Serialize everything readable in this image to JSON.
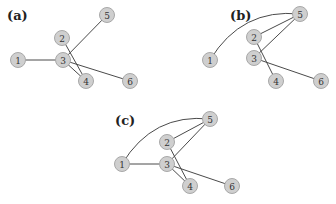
{
  "panels": [
    {
      "label": "(a)",
      "label_pos": [
        7,
        20
      ],
      "nodes": [
        {
          "id": "1",
          "x": 18,
          "y": 60
        },
        {
          "id": "2",
          "x": 62,
          "y": 38
        },
        {
          "id": "3",
          "x": 63,
          "y": 60
        },
        {
          "id": "4",
          "x": 86,
          "y": 81
        },
        {
          "id": "5",
          "x": 107,
          "y": 15
        },
        {
          "id": "6",
          "x": 130,
          "y": 81
        }
      ],
      "edges": [
        {
          "from": "1",
          "to": "3"
        },
        {
          "from": "3",
          "to": "5"
        },
        {
          "from": "2",
          "to": "4"
        },
        {
          "from": "3",
          "to": "4"
        },
        {
          "from": "3",
          "to": "6"
        }
      ]
    },
    {
      "label": "(b)",
      "label_pos": [
        230,
        20
      ],
      "nodes": [
        {
          "id": "1",
          "x": 210,
          "y": 60
        },
        {
          "id": "2",
          "x": 254,
          "y": 37
        },
        {
          "id": "3",
          "x": 254,
          "y": 58
        },
        {
          "id": "4",
          "x": 276,
          "y": 81
        },
        {
          "id": "5",
          "x": 300,
          "y": 14
        },
        {
          "id": "6",
          "x": 321,
          "y": 81
        }
      ],
      "edges": [
        {
          "from": "1",
          "to": "5",
          "curve": true
        },
        {
          "from": "2",
          "to": "5"
        },
        {
          "from": "3",
          "to": "5"
        },
        {
          "from": "2",
          "to": "4"
        },
        {
          "from": "3",
          "to": "6"
        }
      ]
    },
    {
      "label": "(c)",
      "label_pos": [
        115,
        125
      ],
      "nodes": [
        {
          "id": "1",
          "x": 122,
          "y": 164
        },
        {
          "id": "2",
          "x": 167,
          "y": 142
        },
        {
          "id": "3",
          "x": 167,
          "y": 164
        },
        {
          "id": "4",
          "x": 190,
          "y": 186
        },
        {
          "id": "5",
          "x": 210,
          "y": 119
        },
        {
          "id": "6",
          "x": 232,
          "y": 186
        }
      ],
      "edges": [
        {
          "from": "1",
          "to": "5",
          "curve": true
        },
        {
          "from": "1",
          "to": "3"
        },
        {
          "from": "2",
          "to": "5"
        },
        {
          "from": "3",
          "to": "5"
        },
        {
          "from": "2",
          "to": "4"
        },
        {
          "from": "3",
          "to": "4"
        },
        {
          "from": "3",
          "to": "6"
        }
      ]
    }
  ]
}
